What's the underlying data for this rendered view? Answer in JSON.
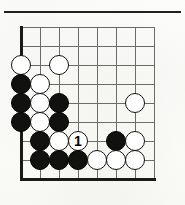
{
  "figure": {
    "kind": "go-diagram"
  },
  "board": {
    "columns": 8,
    "rows": 9,
    "column_x": [
      21,
      40,
      59,
      78,
      97,
      116,
      135,
      154
    ],
    "row_y": [
      27,
      46,
      65,
      84,
      103,
      122,
      141,
      160,
      179
    ],
    "stone_diameter": 20,
    "left_edge_is_board_edge": true,
    "bottom_edge_is_board_edge": true,
    "grid_color": "#6d6b66",
    "edge_color": "#1b1916",
    "paper_color": "#fdfdfb"
  },
  "colors": {
    "black_stone": "#111110",
    "white_stone": "#ffffff",
    "stone_outline": "#15130f",
    "label_on_white": "#000000",
    "rule": "#23211e"
  },
  "stones": [
    {
      "color": "white",
      "col": 1,
      "row": 3,
      "label": ""
    },
    {
      "color": "white",
      "col": 3,
      "row": 3,
      "label": ""
    },
    {
      "color": "black",
      "col": 1,
      "row": 4,
      "label": ""
    },
    {
      "color": "white",
      "col": 2,
      "row": 4,
      "label": ""
    },
    {
      "color": "black",
      "col": 1,
      "row": 5,
      "label": ""
    },
    {
      "color": "white",
      "col": 2,
      "row": 5,
      "label": ""
    },
    {
      "color": "black",
      "col": 3,
      "row": 5,
      "label": ""
    },
    {
      "color": "white",
      "col": 7,
      "row": 5,
      "label": ""
    },
    {
      "color": "black",
      "col": 1,
      "row": 6,
      "label": ""
    },
    {
      "color": "white",
      "col": 2,
      "row": 6,
      "label": ""
    },
    {
      "color": "black",
      "col": 3,
      "row": 6,
      "label": ""
    },
    {
      "color": "black",
      "col": 2,
      "row": 7,
      "label": ""
    },
    {
      "color": "white",
      "col": 3,
      "row": 7,
      "label": ""
    },
    {
      "color": "white",
      "col": 4,
      "row": 7,
      "label": "1"
    },
    {
      "color": "black",
      "col": 6,
      "row": 7,
      "label": ""
    },
    {
      "color": "white",
      "col": 7,
      "row": 7,
      "label": ""
    },
    {
      "color": "black",
      "col": 2,
      "row": 8,
      "label": ""
    },
    {
      "color": "black",
      "col": 3,
      "row": 8,
      "label": ""
    },
    {
      "color": "black",
      "col": 4,
      "row": 8,
      "label": ""
    },
    {
      "color": "white",
      "col": 5,
      "row": 8,
      "label": ""
    },
    {
      "color": "white",
      "col": 6,
      "row": 8,
      "label": ""
    },
    {
      "color": "white",
      "col": 7,
      "row": 8,
      "label": ""
    }
  ],
  "move_markers": [
    {
      "number": "1",
      "color": "white",
      "col": 4,
      "row": 7
    }
  ]
}
